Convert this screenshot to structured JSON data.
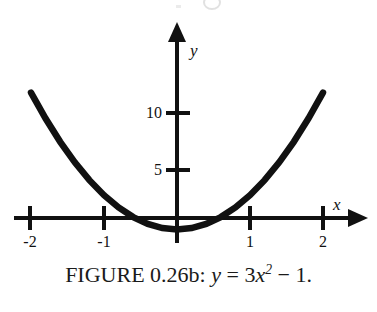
{
  "figure": {
    "caption_prefix": "FIGURE 0.26b:",
    "caption_equation_lhs": "y",
    "caption_equals": "=",
    "caption_coefficient": "3",
    "caption_variable": "x",
    "caption_exponent": "2",
    "caption_minus": "−",
    "caption_constant": "1",
    "caption_period": ".",
    "caption_full": "FIGURE 0.26b: y = 3x² − 1.",
    "background_color": "#ffffff",
    "ink_color": "#111111"
  },
  "chart_data": {
    "type": "line",
    "equation": "y = 3x^2 - 1",
    "xlabel": "x",
    "ylabel": "y",
    "xlim": [
      -2.0,
      2.0
    ],
    "ylim": [
      -1.0,
      11.0
    ],
    "grid": false,
    "legend": false,
    "x_ticks": [
      -2,
      -1,
      1,
      2
    ],
    "x_tick_labels": [
      "-2",
      "-1",
      "1",
      "2"
    ],
    "y_ticks": [
      5,
      10
    ],
    "y_tick_labels": [
      "5",
      "10"
    ],
    "axis_arrows": [
      "x-positive",
      "y-positive"
    ],
    "vertex": [
      0,
      -1
    ],
    "roots": [
      -0.577,
      0.577
    ],
    "series": [
      {
        "name": "y = 3x^2 - 1",
        "x": [
          -2.0,
          -1.8,
          -1.6,
          -1.4,
          -1.2,
          -1.0,
          -0.8,
          -0.6,
          -0.4,
          -0.2,
          0.0,
          0.2,
          0.4,
          0.6,
          0.8,
          1.0,
          1.2,
          1.4,
          1.6,
          1.8,
          2.0
        ],
        "values": [
          11.0,
          8.72,
          6.68,
          4.88,
          3.32,
          2.0,
          0.92,
          0.08,
          -0.52,
          -0.88,
          -1.0,
          -0.88,
          -0.52,
          0.08,
          0.92,
          2.0,
          3.32,
          4.88,
          6.68,
          8.72,
          11.0
        ]
      }
    ]
  },
  "axes": {
    "y_label_text": "y",
    "x_label_text": "x"
  }
}
